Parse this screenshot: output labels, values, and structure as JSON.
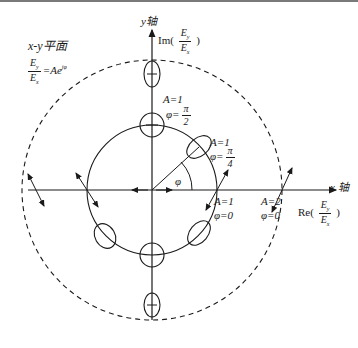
{
  "figure": {
    "plane_title": "x-y平面",
    "relation": {
      "numerator": "E",
      "numerator_sub": "y",
      "denominator": "E",
      "denominator_sub": "x",
      "rhs": "=Ae",
      "rhs_sup": "jφ"
    },
    "axes": {
      "y_label": "y轴",
      "y_complex_label": "Im(",
      "y_complex_num": "E",
      "y_complex_num_sub": "y",
      "y_complex_den": "E",
      "y_complex_den_sub": "x",
      "y_complex_close": ")",
      "x_label": "x 轴",
      "x_complex_label": "Re(",
      "x_complex_num": "E",
      "x_complex_num_sub": "y",
      "x_complex_den": "E",
      "x_complex_den_sub": "x",
      "x_complex_close": ")"
    },
    "annotations": {
      "a1_phi_pi2_A": "A=1",
      "a1_phi_pi2_phi": "φ=",
      "a1_phi_pi2_num": "π",
      "a1_phi_pi2_den": "2",
      "a1_phi_pi4_A": "A=1",
      "a1_phi_pi4_phi": "φ=",
      "a1_phi_pi4_num": "π",
      "a1_phi_pi4_den": "4",
      "angle_label": "φ",
      "a1_phi0_A": "A=1",
      "a1_phi0_phi": "φ=0",
      "a2_phi0_A": "A=2",
      "a2_phi0_phi": "φ=0"
    },
    "circles": [
      {
        "name": "unit-circle",
        "amplitude": 1,
        "style": "solid"
      },
      {
        "name": "amplitude-2-circle",
        "amplitude": 2,
        "style": "dashed"
      }
    ],
    "colors": {
      "line": "#1a1a1a",
      "top_border": "#7a7a7a",
      "background": "#ffffff"
    }
  }
}
